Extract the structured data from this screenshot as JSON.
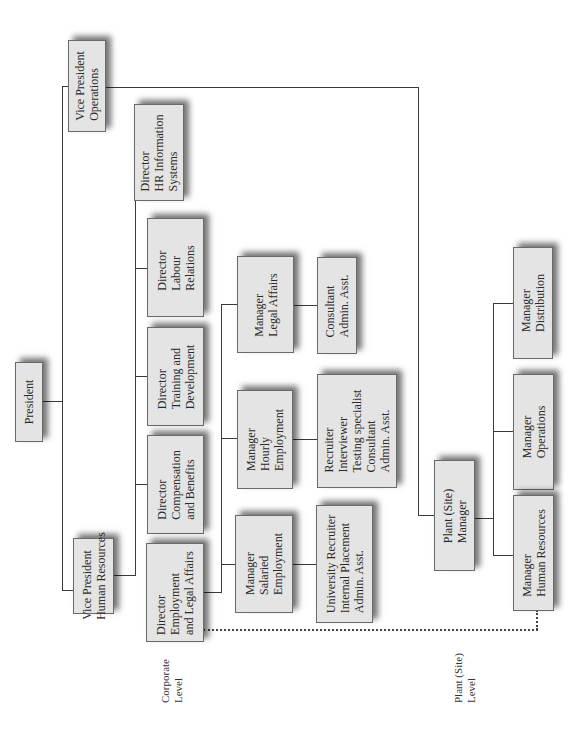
{
  "diagram": {
    "type": "organization-chart",
    "orientation": "rotated-90-ccw",
    "colors": {
      "box_fill": "#e4e4e4",
      "box_border": "#6a6a6a",
      "line": "#3a3a3a",
      "background": "#ffffff"
    },
    "levels": {
      "corporate": {
        "lines": [
          "Corporate",
          "Level"
        ]
      },
      "plant": {
        "lines": [
          "Plant (Site)",
          "Level"
        ]
      }
    },
    "nodes": {
      "president": {
        "lines": [
          "President"
        ]
      },
      "vp_operations": {
        "lines": [
          "Vice President",
          "Operations"
        ]
      },
      "vp_hr": {
        "lines": [
          "Vice President",
          "Human Resources"
        ]
      },
      "dir_hris": {
        "lines": [
          "Director",
          "HR Information",
          "Systems"
        ]
      },
      "dir_labour": {
        "lines": [
          "Director",
          "Labour",
          "Relations"
        ]
      },
      "dir_training": {
        "lines": [
          "Director",
          "Training and",
          "Development"
        ]
      },
      "dir_comp": {
        "lines": [
          "Director",
          "Compensation",
          "and Benefits"
        ]
      },
      "dir_employment": {
        "lines": [
          "Director",
          "Employment",
          "and Legal Affairs"
        ]
      },
      "mgr_legal": {
        "lines": [
          "Manager",
          "Legal Affairs"
        ]
      },
      "legal_staff": {
        "lines": [
          "Consultant",
          "Admin. Asst."
        ]
      },
      "mgr_hourly": {
        "lines": [
          "Manager",
          "Hourly",
          "Employment"
        ]
      },
      "hourly_staff": {
        "lines": [
          "Recruiter",
          "Interviewer",
          "Testing specialist",
          "Consultant",
          "Admin. Asst."
        ]
      },
      "mgr_salaried": {
        "lines": [
          "Manager",
          "Salaried",
          "Employment"
        ]
      },
      "salaried_staff": {
        "lines": [
          "University Recruiter",
          "Internal Placement",
          "Admin. Asst."
        ]
      },
      "plant_manager": {
        "lines": [
          "Plant (Site)",
          "Manager"
        ]
      },
      "mgr_distribution": {
        "lines": [
          "Manager",
          "Distribution"
        ]
      },
      "mgr_operations": {
        "lines": [
          "Manager",
          "Operations"
        ]
      },
      "mgr_plant_hr": {
        "lines": [
          "Manager",
          "Human Resources"
        ]
      }
    },
    "edges": [
      [
        "president",
        "vp_operations"
      ],
      [
        "president",
        "vp_hr"
      ],
      [
        "vp_hr",
        "dir_hris"
      ],
      [
        "vp_hr",
        "dir_labour"
      ],
      [
        "vp_hr",
        "dir_training"
      ],
      [
        "vp_hr",
        "dir_comp"
      ],
      [
        "vp_hr",
        "dir_employment"
      ],
      [
        "dir_employment",
        "mgr_legal"
      ],
      [
        "dir_employment",
        "mgr_hourly"
      ],
      [
        "dir_employment",
        "mgr_salaried"
      ],
      [
        "mgr_legal",
        "legal_staff"
      ],
      [
        "mgr_hourly",
        "hourly_staff"
      ],
      [
        "mgr_salaried",
        "salaried_staff"
      ],
      [
        "vp_operations",
        "plant_manager"
      ],
      [
        "plant_manager",
        "mgr_distribution"
      ],
      [
        "plant_manager",
        "mgr_operations"
      ],
      [
        "plant_manager",
        "mgr_plant_hr"
      ]
    ],
    "dotted_edges": [
      [
        "dir_employment",
        "mgr_plant_hr"
      ]
    ]
  }
}
